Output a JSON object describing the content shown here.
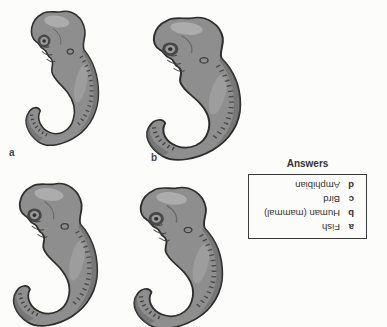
{
  "figure": {
    "labels": {
      "a": "a",
      "b": "b"
    },
    "embryo_count": 4
  },
  "answers": {
    "title": "Answers",
    "upside_down": true,
    "items": [
      {
        "letter": "a",
        "text": "Fish"
      },
      {
        "letter": "b",
        "text": "Human (mammal)"
      },
      {
        "letter": "c",
        "text": "Bird"
      },
      {
        "letter": "d",
        "text": "Amphibian"
      }
    ]
  },
  "colors": {
    "background": "#fcfcfb",
    "embryo_body": "#8e8e8e",
    "embryo_shadow": "#646464",
    "embryo_outline": "#2e2e2e",
    "box_border": "#3a3a3a",
    "text": "#333333"
  }
}
